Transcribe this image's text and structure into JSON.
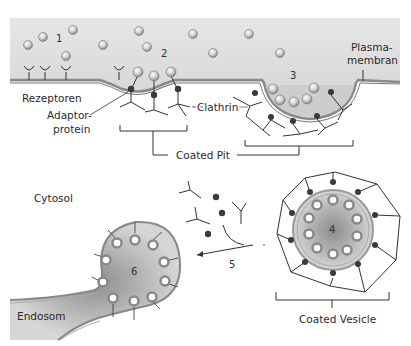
{
  "figure": {
    "labels": {
      "step1": "1",
      "step2": "2",
      "step3": "3",
      "step4": "4",
      "step5": "5",
      "step6": "6",
      "receptors": "Rezeptoren",
      "adaptor_line1": "Adaptor-",
      "adaptor_line2": "protein",
      "clathrin": "Clathrin",
      "coated_pit": "Coated Pit",
      "plasma_line1": "Plasma-",
      "plasma_line2": "membran",
      "cytosol": "Cytosol",
      "endosome": "Endosom",
      "coated_vesicle": "Coated Vesicle"
    },
    "colors": {
      "extracellular": "#d9d9d9",
      "membrane": "#8a8a8a",
      "vesicle_fill": "#bdbdbd",
      "adaptor_dot": "#3a3a3a",
      "line": "#333333"
    }
  }
}
